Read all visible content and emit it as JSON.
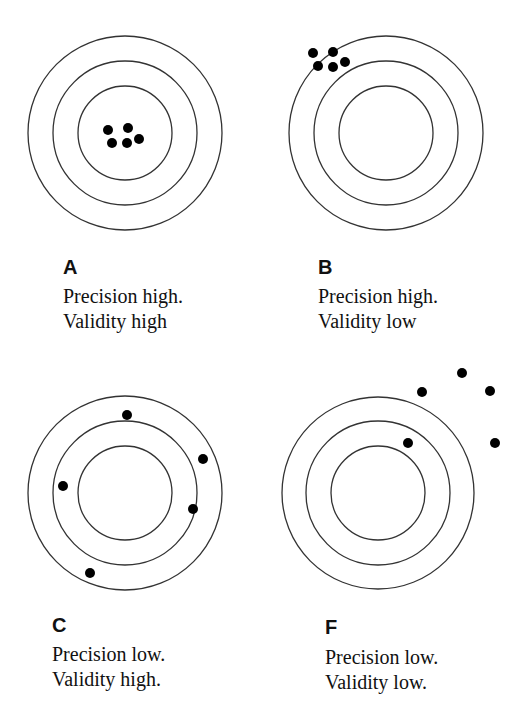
{
  "figure": {
    "panels": [
      {
        "id": "A",
        "letter": "A",
        "line1": "Precision high.",
        "line2": "Validity high",
        "target": {
          "cx": 125,
          "cy": 133,
          "radii": [
            97,
            72,
            47
          ]
        },
        "shots": [
          [
            108,
            130
          ],
          [
            128,
            128
          ],
          [
            112,
            143
          ],
          [
            127,
            143
          ],
          [
            139,
            139
          ]
        ]
      },
      {
        "id": "B",
        "letter": "B",
        "line1": "Precision high.",
        "line2": "Validity low",
        "target": {
          "cx": 386,
          "cy": 133,
          "radii": [
            97,
            72,
            47
          ]
        },
        "shots": [
          [
            313,
            53
          ],
          [
            333,
            52
          ],
          [
            318,
            66
          ],
          [
            333,
            67
          ],
          [
            345,
            62
          ]
        ]
      },
      {
        "id": "C",
        "letter": "C",
        "line1": "Precision low.",
        "line2": "Validity high.",
        "target": {
          "cx": 125,
          "cy": 493,
          "radii": [
            97,
            72,
            47
          ]
        },
        "shots": [
          [
            127,
            415
          ],
          [
            203,
            459
          ],
          [
            63,
            486
          ],
          [
            193,
            509
          ],
          [
            90,
            573
          ]
        ]
      },
      {
        "id": "F",
        "letter": "F",
        "line1": "Precision low.",
        "line2": "Validity low.",
        "target": {
          "cx": 378,
          "cy": 493,
          "radii": [
            96,
            72,
            47
          ]
        },
        "shots": [
          [
            422,
            392
          ],
          [
            462,
            373
          ],
          [
            490,
            391
          ],
          [
            408,
            443
          ],
          [
            495,
            443
          ]
        ]
      }
    ],
    "colors": {
      "ring": "#333333",
      "shot": "#000000",
      "text": "#111111",
      "background": "#ffffff"
    }
  }
}
